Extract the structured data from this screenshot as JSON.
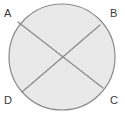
{
  "figure": {
    "kind": "geometry-diagram",
    "background_color": "#ffffff",
    "canvas": {
      "width": 125,
      "height": 116
    },
    "circle": {
      "center_x": 62,
      "center_y": 57,
      "radius": 53,
      "fill_color": "#e9e9e9",
      "stroke_color": "#8a8a8a",
      "stroke_width": 1.2
    },
    "chords": [
      {
        "name": "chord-A-C",
        "x1": 18,
        "y1": 22,
        "x2": 103,
        "y2": 88,
        "stroke_color": "#8a8a8a",
        "stroke_width": 1.2
      },
      {
        "name": "chord-B-D",
        "x1": 100,
        "y1": 25,
        "x2": 22,
        "y2": 92,
        "stroke_color": "#8a8a8a",
        "stroke_width": 1.2
      }
    ],
    "labels": {
      "top_left": "A",
      "top_right": "B",
      "bottom_right": "C",
      "bottom_left": "D"
    },
    "label_color": "#3a3a3a"
  }
}
